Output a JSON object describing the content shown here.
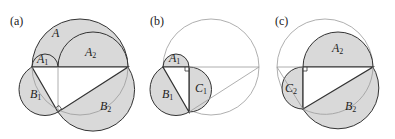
{
  "figure": {
    "colors": {
      "fill": "#d9d9d9",
      "stroke": "#333333",
      "thin": "#9a9a9a"
    },
    "panels": [
      {
        "id": "a",
        "label": "(a)",
        "regions": [
          {
            "name": "A",
            "main": "A",
            "sub": ""
          },
          {
            "name": "A1",
            "main": "A",
            "sub": "1"
          },
          {
            "name": "A2",
            "main": "A",
            "sub": "2"
          },
          {
            "name": "B1",
            "main": "B",
            "sub": "1"
          },
          {
            "name": "B2",
            "main": "B",
            "sub": "2"
          }
        ]
      },
      {
        "id": "b",
        "label": "(b)",
        "regions": [
          {
            "name": "A1",
            "main": "A",
            "sub": "1"
          },
          {
            "name": "B1",
            "main": "B",
            "sub": "1"
          },
          {
            "name": "C1",
            "main": "C",
            "sub": "1"
          }
        ]
      },
      {
        "id": "c",
        "label": "(c)",
        "regions": [
          {
            "name": "A2",
            "main": "A",
            "sub": "2"
          },
          {
            "name": "B2",
            "main": "B",
            "sub": "2"
          },
          {
            "name": "C2",
            "main": "C",
            "sub": "2"
          }
        ]
      }
    ]
  }
}
